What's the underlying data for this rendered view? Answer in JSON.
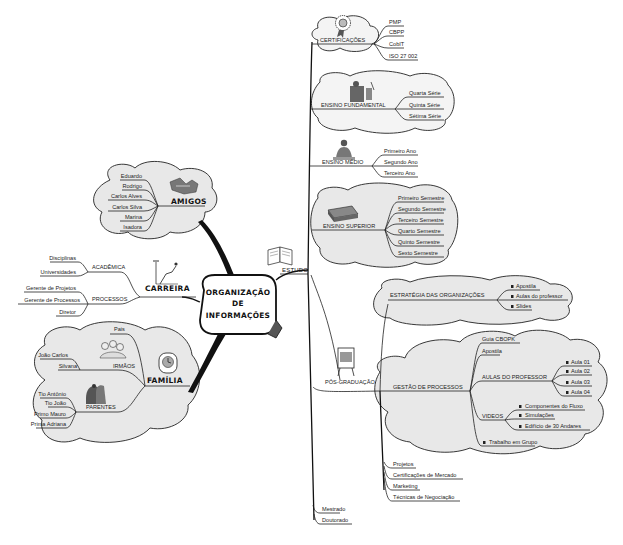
{
  "center": {
    "line1": "ORGANIZAÇÃO",
    "line2": "DE",
    "line3": "INFORMAÇÕES"
  },
  "estudo": {
    "label": "ESTUDO",
    "certificacoes": {
      "label": "CERTIFICAÇÕES",
      "items": [
        "PMP",
        "CBPP",
        "CobIT",
        "ISO 27 002"
      ]
    },
    "fundamental": {
      "label": "ENSINO FUNDAMENTAL",
      "items": [
        "Quarta Série",
        "Quinta Série",
        "Sétima Série"
      ]
    },
    "medio": {
      "label": "ENSINO MÉDIO",
      "items": [
        "Primeiro Ano",
        "Segundo Ano",
        "Terceiro Ano"
      ]
    },
    "superior": {
      "label": "ENSINO SUPERIOR",
      "items": [
        "Primeiro Semestre",
        "Segundo Semestre",
        "Terceiro Semestre",
        "Quarto Semestre",
        "Quinto Semestre",
        "Sexto Semestre"
      ]
    },
    "pos": {
      "label": "PÓS-GRADUAÇÃO",
      "estrategia": {
        "label": "ESTRATÉGIA DAS ORGANIZAÇÕES",
        "items": [
          "Apostila",
          "Aulas do professor",
          "Slides"
        ]
      },
      "gestao": {
        "label": "GESTÃO DE PROCESSOS",
        "guia": "Guia CBOPK",
        "apostila": "Apostila",
        "aulas": {
          "label": "AULAS DO PROFESSOR",
          "items": [
            "Aula 01",
            "Aula 02",
            "Aula 03",
            "Aula 04"
          ]
        },
        "videos": {
          "label": "VIDEOS",
          "items": [
            "Componentes do Fluxo",
            "Simulações",
            "Edifício de 30 Andares"
          ]
        },
        "trabalho": "Trabalho em Grupo"
      },
      "others": [
        "Projetos",
        "Certificações de Mercado",
        "Marketing",
        "Técnicas de Negociação"
      ]
    },
    "mestrado": "Mestrado",
    "doutorado": "Doutorado"
  },
  "amigos": {
    "label": "AMIGOS",
    "items": [
      "Eduardo",
      "Rodrigo",
      "Carlos Alves",
      "Carlos Silva",
      "Marina",
      "Isadora"
    ]
  },
  "carreira": {
    "label": "CARREIRA",
    "academica": {
      "label": "ACADÊMICA",
      "items": [
        "Disciplinas",
        "Universidades"
      ]
    },
    "processos": {
      "label": "PROCESSOS",
      "items": [
        "Gerente de Projetos",
        "Gerente de Processos",
        "Diretor"
      ]
    }
  },
  "familia": {
    "label": "FAMÍLIA",
    "pais": "Pais",
    "irmaos": {
      "label": "IRMÃOS",
      "items": [
        "João Carlos",
        "Silvana"
      ]
    },
    "parentes": {
      "label": "PARENTES",
      "items": [
        "Tio Antônio",
        "Tio João",
        "Primo Mauro",
        "Prima Adriana"
      ]
    }
  },
  "colors": {
    "cloud_fill": "#e8e8e8",
    "line": "#222222",
    "background": "#ffffff"
  }
}
